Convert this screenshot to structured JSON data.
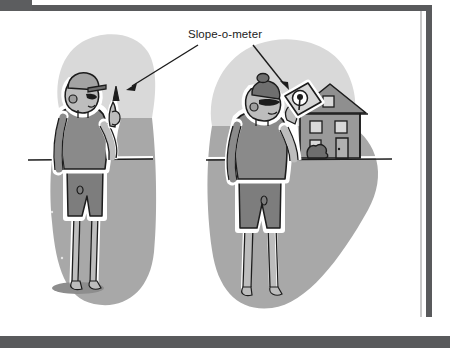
{
  "figure": {
    "callout": {
      "label": "Slope-o-meter",
      "label_x": 225,
      "label_y": 37,
      "arrow_left": "points to the raised hand of the left figure",
      "arrow_right": "points to the tilted gauge card held by the right figure"
    },
    "scenes": [
      {
        "name": "left-scene",
        "description": "Person standing on sloped ground holding an imaginary slope-o-meter",
        "figure_label": "person-left",
        "has_house": false,
        "has_shadow": true
      },
      {
        "name": "right-scene",
        "description": "Person standing in front of a house holding a slope-o-meter card with a dial",
        "figure_label": "person-right",
        "has_house": true,
        "has_shadow": false
      }
    ],
    "house": {
      "name": "house",
      "windows": 5,
      "door": 1,
      "bush": 1
    },
    "device": {
      "name": "slope-o-meter-card",
      "shape": "tilted-square",
      "dial": "circular gauge with needle"
    }
  },
  "colors": {
    "frame_dark": "#595a5c",
    "frame_tab": "#5c5d5f",
    "page_white": "#ffffff",
    "sky_blob": "#d9d9d9",
    "ground_blob": "#a8a8a8",
    "ground_shadow": "#8d8d8d",
    "skin": "#bdbdbd",
    "shirt": "#8a8a8a",
    "shorts": "#7d7d7d",
    "cap": "#a3a3a3",
    "house_body": "#9a9a9a",
    "house_roof": "#8f8f8f",
    "window_light": "#d8d8d8",
    "ink": "#1c1c1c",
    "outline_white": "#ffffff"
  }
}
